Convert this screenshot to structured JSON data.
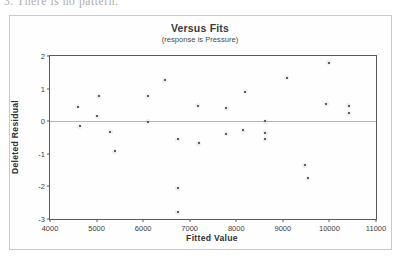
{
  "page": {
    "scan_note": "3.  There is no pattern."
  },
  "chart_data": {
    "type": "scatter",
    "title": "Versus Fits",
    "subtitle": "(response is Pressure)",
    "xlabel": "Fitted Value",
    "ylabel": "Deleted Residual",
    "xlim": [
      4000,
      11000
    ],
    "ylim": [
      -3,
      2
    ],
    "xticks": [
      4000,
      5000,
      6000,
      7000,
      8000,
      9000,
      10000,
      11000
    ],
    "yticks": [
      2,
      1,
      0,
      -1,
      -2,
      -3
    ],
    "grid": false,
    "legend": null,
    "reference_line_y": 0,
    "marker": "open-circle",
    "point_color": "#5a5a5a",
    "frame_color": "#585858",
    "points": [
      {
        "x": 4600,
        "y": 0.45
      },
      {
        "x": 4640,
        "y": -0.15
      },
      {
        "x": 5050,
        "y": 0.77
      },
      {
        "x": 5010,
        "y": 0.15
      },
      {
        "x": 5290,
        "y": -0.33
      },
      {
        "x": 5390,
        "y": -0.92
      },
      {
        "x": 6100,
        "y": 0.76
      },
      {
        "x": 6100,
        "y": -0.02
      },
      {
        "x": 6460,
        "y": 1.25
      },
      {
        "x": 6740,
        "y": -0.56
      },
      {
        "x": 6740,
        "y": -2.05
      },
      {
        "x": 6740,
        "y": -2.8
      },
      {
        "x": 7170,
        "y": 0.47
      },
      {
        "x": 7190,
        "y": -0.68
      },
      {
        "x": 7780,
        "y": 0.4
      },
      {
        "x": 7780,
        "y": -0.38
      },
      {
        "x": 8190,
        "y": 0.9
      },
      {
        "x": 8150,
        "y": -0.28
      },
      {
        "x": 8620,
        "y": 0.0
      },
      {
        "x": 8620,
        "y": -0.35
      },
      {
        "x": 8620,
        "y": -0.55
      },
      {
        "x": 9080,
        "y": 1.33
      },
      {
        "x": 9470,
        "y": -1.35
      },
      {
        "x": 9530,
        "y": -1.75
      },
      {
        "x": 9990,
        "y": 1.8
      },
      {
        "x": 9930,
        "y": 0.53
      },
      {
        "x": 10420,
        "y": 0.47
      },
      {
        "x": 10420,
        "y": 0.25
      }
    ]
  }
}
